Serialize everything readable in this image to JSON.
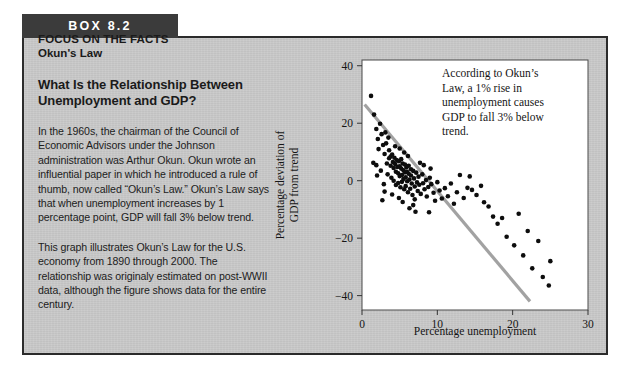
{
  "box": {
    "header_label": "BOX 8.2",
    "eyebrow_line1": "FOCUS ON THE FACTS",
    "eyebrow_line2": "Okun's Law",
    "section_heading_line1": "What Is the Relationship Between",
    "section_heading_line2": "Unemployment and GDP?",
    "paragraph_1": "In the 1960s, the chairman of the Council of Economic Advisors under the Johnson administration was Arthur Okun. Okun wrote an influential paper in which he introduced a rule of thumb, now called “Okun’s Law.” Okun’s Law says that when unemployment increases by 1 percentage point, GDP will fall 3% below trend.",
    "paragraph_2": "This graph illustrates Okun’s Law for the U.S. economy from 1890 through 2000. The relationship was originaly estimated on post-WWII data, although the figure shows data for the entire century.",
    "colors": {
      "header_bar": "#3b3b3b",
      "body_fill": "#c9c9c9",
      "border": "#2b2b2b"
    }
  },
  "chart_data": {
    "type": "scatter",
    "title": "",
    "xlabel": "Percentage unemployment",
    "ylabel": "Percentage deviation of GDP from trend",
    "xlim": [
      0,
      30
    ],
    "ylim": [
      -45,
      42
    ],
    "xticks": [
      0,
      10,
      20,
      30
    ],
    "xtick_labels": [
      "0",
      "10",
      "20",
      "30"
    ],
    "yticks": [
      40,
      20,
      0,
      -20,
      -40
    ],
    "ytick_labels": [
      "40",
      "20",
      "0",
      "−20",
      "−40"
    ],
    "grid": false,
    "legend": false,
    "point_color": "#0d0d0d",
    "trend_color": "#a2a2a2",
    "annotation": {
      "lines": [
        "According to Okun’s",
        "Law, a 1% rise in",
        "unemployment causes",
        "GDP to fall 3% below",
        "trend."
      ]
    },
    "trend_line": {
      "x": [
        0.35,
        22.3
      ],
      "y": [
        26.5,
        -42.0
      ]
    },
    "series": [
      {
        "name": "U.S. economy 1890-2000",
        "points": [
          [
            1.2,
            29.5
          ],
          [
            1.6,
            23.0
          ],
          [
            1.9,
            18.0
          ],
          [
            2.1,
            14.5
          ],
          [
            1.5,
            6.2
          ],
          [
            1.9,
            5.4
          ],
          [
            2.4,
            19.8
          ],
          [
            2.6,
            16.2
          ],
          [
            2.2,
            11.0
          ],
          [
            2.5,
            3.5
          ],
          [
            2.8,
            12.4
          ],
          [
            3.0,
            9.3
          ],
          [
            3.2,
            13.0
          ],
          [
            3.3,
            6.0
          ],
          [
            3.4,
            2.2
          ],
          [
            3.6,
            10.6
          ],
          [
            3.6,
            7.8
          ],
          [
            3.8,
            8.4
          ],
          [
            3.8,
            5.2
          ],
          [
            3.9,
            1.0
          ],
          [
            4.0,
            9.1
          ],
          [
            4.1,
            6.5
          ],
          [
            4.2,
            4.4
          ],
          [
            4.2,
            0.0
          ],
          [
            4.3,
            8.0
          ],
          [
            4.4,
            5.8
          ],
          [
            4.5,
            3.1
          ],
          [
            4.5,
            -1.5
          ],
          [
            4.6,
            7.2
          ],
          [
            4.7,
            4.8
          ],
          [
            4.8,
            2.6
          ],
          [
            4.8,
            -0.8
          ],
          [
            4.9,
            6.8
          ],
          [
            5.0,
            5.0
          ],
          [
            5.0,
            1.6
          ],
          [
            5.1,
            -2.3
          ],
          [
            5.2,
            7.5
          ],
          [
            5.2,
            4.2
          ],
          [
            5.3,
            2.0
          ],
          [
            5.3,
            -0.4
          ],
          [
            5.4,
            6.0
          ],
          [
            5.5,
            3.6
          ],
          [
            5.5,
            0.6
          ],
          [
            5.6,
            -3.0
          ],
          [
            5.7,
            5.6
          ],
          [
            5.7,
            2.9
          ],
          [
            5.8,
            1.2
          ],
          [
            5.8,
            -1.9
          ],
          [
            5.9,
            4.6
          ],
          [
            6.0,
            3.0
          ],
          [
            6.0,
            -0.2
          ],
          [
            6.1,
            -4.0
          ],
          [
            6.2,
            5.2
          ],
          [
            6.2,
            2.4
          ],
          [
            6.3,
            0.4
          ],
          [
            6.4,
            -2.8
          ],
          [
            6.5,
            4.0
          ],
          [
            6.5,
            1.8
          ],
          [
            6.6,
            -1.0
          ],
          [
            6.7,
            -5.0
          ],
          [
            6.8,
            3.4
          ],
          [
            6.9,
            0.8
          ],
          [
            7.0,
            -2.0
          ],
          [
            7.0,
            -6.5
          ],
          [
            7.2,
            2.8
          ],
          [
            7.3,
            -0.6
          ],
          [
            7.4,
            -3.6
          ],
          [
            7.5,
            1.4
          ],
          [
            7.6,
            -1.4
          ],
          [
            7.8,
            -4.6
          ],
          [
            8.0,
            2.2
          ],
          [
            8.1,
            -0.9
          ],
          [
            8.3,
            -3.0
          ],
          [
            8.5,
            0.2
          ],
          [
            8.6,
            -5.5
          ],
          [
            8.8,
            -2.2
          ],
          [
            9.0,
            1.0
          ],
          [
            9.2,
            -1.2
          ],
          [
            9.5,
            -4.2
          ],
          [
            9.7,
            -7.0
          ],
          [
            10.0,
            -0.5
          ],
          [
            10.3,
            -3.4
          ],
          [
            10.6,
            -6.2
          ],
          [
            11.0,
            -2.6
          ],
          [
            11.4,
            -5.4
          ],
          [
            11.8,
            -1.0
          ],
          [
            12.2,
            -8.0
          ],
          [
            12.6,
            -4.0
          ],
          [
            13.0,
            2.0
          ],
          [
            13.5,
            -6.0
          ],
          [
            14.0,
            -2.5
          ],
          [
            14.3,
            1.5
          ],
          [
            14.6,
            -3.2
          ],
          [
            15.2,
            -5.0
          ],
          [
            15.8,
            -1.8
          ],
          [
            16.2,
            -7.5
          ],
          [
            16.8,
            -9.0
          ],
          [
            17.4,
            -12.5
          ],
          [
            18.0,
            -15.0
          ],
          [
            18.6,
            -13.0
          ],
          [
            19.2,
            -19.5
          ],
          [
            20.2,
            -22.5
          ],
          [
            20.8,
            -11.5
          ],
          [
            21.4,
            -26.0
          ],
          [
            22.0,
            -17.5
          ],
          [
            22.6,
            -30.5
          ],
          [
            23.4,
            -21.0
          ],
          [
            24.0,
            -33.5
          ],
          [
            24.8,
            -36.5
          ],
          [
            25.0,
            -28.0
          ],
          [
            2.0,
            1.8
          ],
          [
            2.9,
            -1.2
          ],
          [
            3.1,
            16.8
          ],
          [
            3.5,
            15.0
          ],
          [
            4.4,
            12.0
          ],
          [
            5.0,
            11.2
          ],
          [
            5.6,
            9.8
          ],
          [
            6.1,
            8.6
          ],
          [
            6.8,
            -8.5
          ],
          [
            7.7,
            6.2
          ],
          [
            8.2,
            5.4
          ],
          [
            9.1,
            4.2
          ],
          [
            4.0,
            -4.8
          ],
          [
            4.9,
            -6.0
          ],
          [
            5.4,
            -7.4
          ],
          [
            6.3,
            -9.6
          ],
          [
            7.1,
            -10.8
          ],
          [
            3.0,
            -3.8
          ],
          [
            2.7,
            -6.8
          ],
          [
            8.9,
            -11.0
          ]
        ]
      }
    ]
  }
}
